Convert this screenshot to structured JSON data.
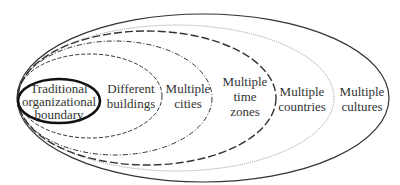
{
  "diagram": {
    "type": "nested-ellipses",
    "rings": [
      {
        "id": "traditional",
        "lines": [
          "Traditional",
          "organizational",
          "boundary"
        ],
        "stroke": "#111111",
        "style": "solid-bold"
      },
      {
        "id": "buildings",
        "lines": [
          "Different",
          "buildings"
        ],
        "stroke": "#333333",
        "style": "dashed"
      },
      {
        "id": "cities",
        "lines": [
          "Multiple",
          "cities"
        ],
        "stroke": "#333333",
        "style": "dash-dot"
      },
      {
        "id": "timezones",
        "lines": [
          "Multiple",
          "time",
          "zones"
        ],
        "stroke": "#333333",
        "style": "long-dash"
      },
      {
        "id": "countries",
        "lines": [
          "Multiple",
          "countries"
        ],
        "stroke": "#999999",
        "style": "dotted"
      },
      {
        "id": "cultures",
        "lines": [
          "Multiple",
          "cultures"
        ],
        "stroke": "#333333",
        "style": "solid"
      }
    ]
  }
}
